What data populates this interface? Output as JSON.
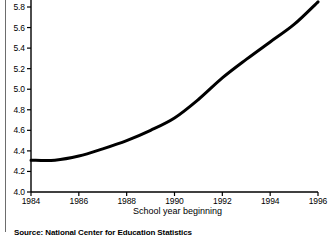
{
  "chart_data": {
    "type": "line",
    "title": "",
    "subtitle": "",
    "xlabel": "School year beginning",
    "ylabel": "",
    "xlim": [
      1984,
      1996
    ],
    "ylim": [
      4.0,
      5.9
    ],
    "grid": false,
    "legend": "none",
    "x_ticks": [
      "1984",
      "1986",
      "1988",
      "1990",
      "1992",
      "1994",
      "1996"
    ],
    "y_ticks": [
      "4.0",
      "4.2",
      "4.4",
      "4.6",
      "4.8",
      "5.0",
      "5.2",
      "5.4",
      "5.6",
      "5.8"
    ],
    "series": [
      {
        "name": "Enrollment",
        "x": [
          1984,
          1985,
          1986,
          1987,
          1988,
          1989,
          1990,
          1991,
          1992,
          1993,
          1994,
          1995,
          1996
        ],
        "values": [
          4.31,
          4.31,
          4.35,
          4.42,
          4.5,
          4.6,
          4.72,
          4.9,
          5.11,
          5.29,
          5.46,
          5.63,
          5.85
        ]
      }
    ],
    "line_color": "#000000",
    "line_width": 3,
    "annotations": []
  },
  "axis": {
    "x_title": "School year beginning",
    "x_ticks": [
      {
        "label": "1984",
        "value": 1984
      },
      {
        "label": "1986",
        "value": 1986
      },
      {
        "label": "1988",
        "value": 1988
      },
      {
        "label": "1990",
        "value": 1990
      },
      {
        "label": "1992",
        "value": 1992
      },
      {
        "label": "1994",
        "value": 1994
      },
      {
        "label": "1996",
        "value": 1996
      }
    ],
    "y_ticks": [
      {
        "label": "5.8",
        "value": 5.8
      },
      {
        "label": "5.6",
        "value": 5.6
      },
      {
        "label": "5.4",
        "value": 5.4
      },
      {
        "label": "5.2",
        "value": 5.2
      },
      {
        "label": "5.0",
        "value": 5.0
      },
      {
        "label": "4.8",
        "value": 4.8
      },
      {
        "label": "4.6",
        "value": 4.6
      },
      {
        "label": "4.4",
        "value": 4.4
      },
      {
        "label": "4.2",
        "value": 4.2
      },
      {
        "label": "4.0",
        "value": 4.0
      }
    ]
  },
  "footer": {
    "source": "Source: National Center for Education Statistics"
  }
}
